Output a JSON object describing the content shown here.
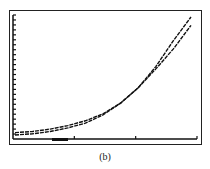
{
  "caption": "(b)",
  "chart_data": {
    "type": "line",
    "title": "",
    "xlabel": "",
    "ylabel": "",
    "grid": false,
    "legend": null,
    "axes": {
      "y_ticks_count": 25,
      "x_ticks_count": 3
    },
    "series": [
      {
        "name": "curve-1",
        "description": "steeper exponential, crosses other near x≈0.8",
        "x": [
          0,
          0.1,
          0.2,
          0.3,
          0.4,
          0.5,
          0.6,
          0.7,
          0.8,
          0.9,
          1.0
        ],
        "y": [
          0.02,
          0.03,
          0.05,
          0.08,
          0.12,
          0.18,
          0.27,
          0.4,
          0.58,
          0.8,
          1.0
        ]
      },
      {
        "name": "curve-2",
        "description": "slightly shallower exponential",
        "x": [
          0,
          0.1,
          0.2,
          0.3,
          0.4,
          0.5,
          0.6,
          0.7,
          0.8,
          0.9,
          1.0
        ],
        "y": [
          0.0,
          0.01,
          0.03,
          0.06,
          0.1,
          0.17,
          0.27,
          0.4,
          0.56,
          0.73,
          0.93
        ]
      }
    ]
  }
}
